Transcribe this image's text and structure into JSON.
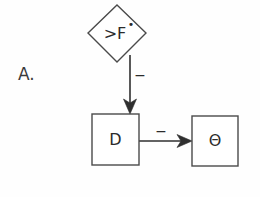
{
  "figure": {
    "panel_letter": "A.",
    "background_color": "#fefefe",
    "stroke_color": "#4a4a4a"
  },
  "nodes": [
    {
      "id": "fstar",
      "label": ">F•",
      "label_main": ">F",
      "label_superscript": "•",
      "shape": "diamond",
      "cx": 117,
      "cy": 33,
      "half_width": 29,
      "half_height": 29,
      "font_size": 16
    },
    {
      "id": "d",
      "label": "D",
      "shape": "rectangle",
      "x": 92,
      "y": 114,
      "width": 47,
      "height": 51,
      "font_size": 16
    },
    {
      "id": "theta",
      "label": "Θ",
      "shape": "rectangle",
      "x": 192,
      "y": 116,
      "width": 46,
      "height": 50,
      "font_size": 16
    }
  ],
  "edges": [
    {
      "id": "fstar-to-d",
      "from": "fstar",
      "to": "d",
      "sign": "−",
      "orientation": "vertical",
      "sign_x": 140,
      "sign_y": 80
    },
    {
      "id": "d-to-theta",
      "from": "d",
      "to": "theta",
      "sign": "−",
      "orientation": "horizontal",
      "sign_x": 161,
      "sign_y": 133
    }
  ]
}
